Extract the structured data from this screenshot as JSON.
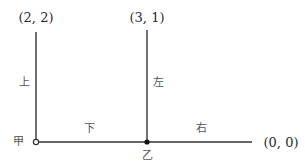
{
  "diagram": {
    "colors": {
      "line": "#333333",
      "text": "#2a2a2a",
      "label": "#555555",
      "background": "#ffffff"
    },
    "points": [
      {
        "id": "top_left",
        "coord_label": "(2, 2)"
      },
      {
        "id": "top_mid",
        "coord_label": "(3, 1)"
      },
      {
        "id": "right_end",
        "coord_label": "(0, 0)"
      },
      {
        "id": "jia",
        "name": "甲",
        "marker": "open-circle"
      },
      {
        "id": "yi",
        "name": "乙",
        "marker": "filled-dot"
      }
    ],
    "edges": [
      {
        "from": "jia",
        "to": "top_left",
        "label": "上"
      },
      {
        "from": "jia",
        "to": "yi",
        "label": "下"
      },
      {
        "from": "yi",
        "to": "top_mid",
        "label": "左"
      },
      {
        "from": "yi",
        "to": "right_end",
        "label": "右"
      }
    ]
  }
}
